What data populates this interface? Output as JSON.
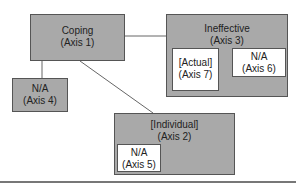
{
  "diagram": {
    "nodes": {
      "coping": {
        "label": "Coping",
        "axis": "(Axis 1)"
      },
      "ineffective": {
        "label": "Ineffective",
        "axis": "(Axis 3)"
      },
      "actual": {
        "label": "[Actual]",
        "axis": "(Axis 7)"
      },
      "na6": {
        "label": "N/A",
        "axis": "(Axis 6)"
      },
      "na4": {
        "label": "N/A",
        "axis": "(Axis 4)"
      },
      "individual": {
        "label": "[Individual]",
        "axis": "(Axis 2)"
      },
      "na5": {
        "label": "N/A",
        "axis": "(Axis 5)"
      }
    },
    "edges": [
      {
        "from": "coping",
        "to": "ineffective"
      },
      {
        "from": "coping",
        "to": "na4"
      },
      {
        "from": "coping",
        "to": "individual"
      }
    ],
    "colors": {
      "box_fill": "#a9a9a9",
      "inner_fill": "#ffffff",
      "border": "#555555"
    }
  }
}
